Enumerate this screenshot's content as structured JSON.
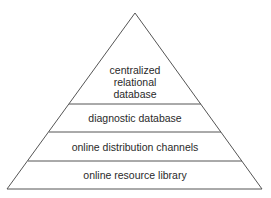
{
  "diagram": {
    "type": "pyramid",
    "levels": [
      {
        "label_lines": [
          "centralized",
          "relational",
          "database"
        ]
      },
      {
        "label": "diagnostic database"
      },
      {
        "label": "online distribution channels"
      },
      {
        "label": "online resource library"
      }
    ],
    "colors": {
      "stroke": "#555555",
      "fill": "#ffffff",
      "text": "#2a2a2a"
    }
  }
}
